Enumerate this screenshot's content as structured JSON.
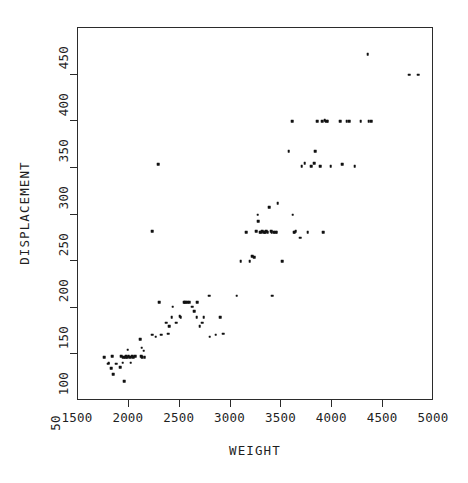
{
  "chart_data": {
    "type": "scatter",
    "title": "",
    "xlabel": "WEIGHT",
    "ylabel": "DISPLACEMENT",
    "xlim": [
      1500,
      5000
    ],
    "ylim": [
      50,
      450
    ],
    "xticks": [
      1500,
      2000,
      2500,
      3000,
      3500,
      4000,
      4500,
      5000
    ],
    "yticks": [
      50,
      100,
      150,
      200,
      250,
      300,
      350,
      400,
      450
    ],
    "grid": false,
    "legend": null,
    "marker": "filled-square",
    "marker_color": "#111111",
    "points": [
      [
        1760,
        97
      ],
      [
        1795,
        90
      ],
      [
        1800,
        91
      ],
      [
        1825,
        85
      ],
      [
        1835,
        98
      ],
      [
        1845,
        79
      ],
      [
        1875,
        90
      ],
      [
        1915,
        86
      ],
      [
        1925,
        98
      ],
      [
        1940,
        91
      ],
      [
        1945,
        97
      ],
      [
        1955,
        71
      ],
      [
        1965,
        97
      ],
      [
        1975,
        98
      ],
      [
        1985,
        97
      ],
      [
        1990,
        105
      ],
      [
        2000,
        98
      ],
      [
        2015,
        97
      ],
      [
        2020,
        91
      ],
      [
        2035,
        98
      ],
      [
        2045,
        97
      ],
      [
        2065,
        98
      ],
      [
        2110,
        116
      ],
      [
        2120,
        98
      ],
      [
        2125,
        107
      ],
      [
        2130,
        97
      ],
      [
        2145,
        104
      ],
      [
        2155,
        97
      ],
      [
        2230,
        232
      ],
      [
        2230,
        121
      ],
      [
        2265,
        119
      ],
      [
        2290,
        304
      ],
      [
        2300,
        156
      ],
      [
        2320,
        121
      ],
      [
        2370,
        134
      ],
      [
        2385,
        122
      ],
      [
        2395,
        130
      ],
      [
        2420,
        140
      ],
      [
        2430,
        151
      ],
      [
        2465,
        134
      ],
      [
        2500,
        141
      ],
      [
        2510,
        140
      ],
      [
        2545,
        156
      ],
      [
        2555,
        156
      ],
      [
        2575,
        156
      ],
      [
        2595,
        156
      ],
      [
        2620,
        151
      ],
      [
        2640,
        146
      ],
      [
        2665,
        140
      ],
      [
        2670,
        156
      ],
      [
        2695,
        130
      ],
      [
        2720,
        134
      ],
      [
        2735,
        140
      ],
      [
        2790,
        163
      ],
      [
        2795,
        119
      ],
      [
        2855,
        121
      ],
      [
        2900,
        140
      ],
      [
        2930,
        122
      ],
      [
        3060,
        163
      ],
      [
        3100,
        200
      ],
      [
        3155,
        231
      ],
      [
        3190,
        200
      ],
      [
        3210,
        205
      ],
      [
        3230,
        204
      ],
      [
        3250,
        232
      ],
      [
        3265,
        250
      ],
      [
        3270,
        243
      ],
      [
        3285,
        231
      ],
      [
        3300,
        231
      ],
      [
        3310,
        232
      ],
      [
        3330,
        231
      ],
      [
        3340,
        231
      ],
      [
        3350,
        232
      ],
      [
        3365,
        231
      ],
      [
        3380,
        258
      ],
      [
        3400,
        232
      ],
      [
        3405,
        231
      ],
      [
        3410,
        163
      ],
      [
        3425,
        231
      ],
      [
        3440,
        231
      ],
      [
        3455,
        231
      ],
      [
        3465,
        262
      ],
      [
        3505,
        200
      ],
      [
        3570,
        318
      ],
      [
        3605,
        350
      ],
      [
        3610,
        250
      ],
      [
        3620,
        231
      ],
      [
        3630,
        231
      ],
      [
        3640,
        232
      ],
      [
        3685,
        225
      ],
      [
        3700,
        302
      ],
      [
        3730,
        305
      ],
      [
        3760,
        231
      ],
      [
        3790,
        302
      ],
      [
        3820,
        305
      ],
      [
        3830,
        318
      ],
      [
        3850,
        350
      ],
      [
        3880,
        302
      ],
      [
        3900,
        350
      ],
      [
        3910,
        231
      ],
      [
        3925,
        351
      ],
      [
        3940,
        350
      ],
      [
        3955,
        350
      ],
      [
        3985,
        302
      ],
      [
        4080,
        350
      ],
      [
        4100,
        304
      ],
      [
        4140,
        350
      ],
      [
        4165,
        350
      ],
      [
        4220,
        302
      ],
      [
        4280,
        350
      ],
      [
        4350,
        422
      ],
      [
        4360,
        350
      ],
      [
        4380,
        350
      ],
      [
        4755,
        400
      ],
      [
        4845,
        400
      ]
    ]
  },
  "axes": {
    "x_tick_labels": [
      "1500",
      "2000",
      "2500",
      "3000",
      "3500",
      "4000",
      "4500",
      "5000"
    ],
    "y_tick_labels": [
      "50",
      "100",
      "150",
      "200",
      "250",
      "300",
      "350",
      "400",
      "450"
    ]
  }
}
